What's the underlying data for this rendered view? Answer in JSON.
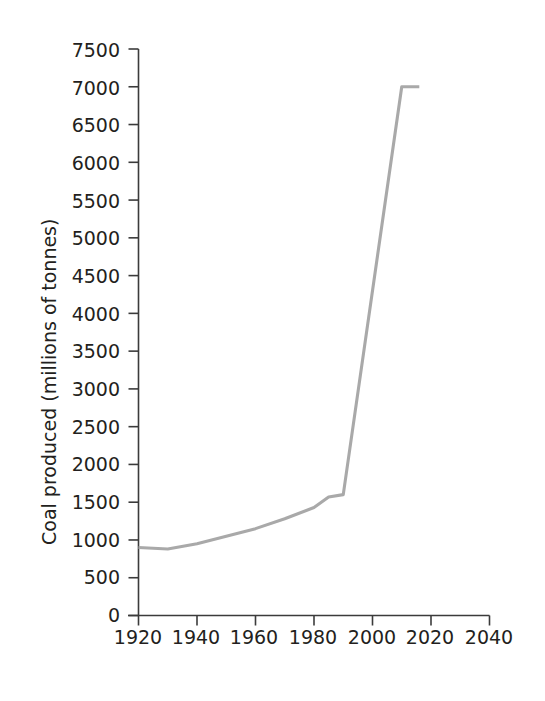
{
  "chart_data": {
    "type": "line",
    "title": "",
    "subtitle": "",
    "xlabel": "",
    "ylabel": "Coal produced (millions of tonnes)",
    "xlim": [
      1920,
      2040
    ],
    "ylim": [
      0,
      7500
    ],
    "grid": false,
    "legend": null,
    "legend_position": "none",
    "line_color": "#a9a9a9",
    "axis_color": "#3b3b3b",
    "text_color": "#231f20",
    "x_ticks": [
      1920,
      1940,
      1960,
      1980,
      2000,
      2020,
      2040
    ],
    "x_tick_labels": [
      "1920",
      "1940",
      "1960",
      "1980",
      "2000",
      "2020",
      "2040"
    ],
    "y_ticks": [
      0,
      500,
      1000,
      1500,
      2000,
      2500,
      3000,
      3500,
      4000,
      4500,
      5000,
      5500,
      6000,
      6500,
      7000,
      7500
    ],
    "y_tick_labels": [
      "0",
      "500",
      "1000",
      "1500",
      "2000",
      "2500",
      "3000",
      "3500",
      "4000",
      "4500",
      "5000",
      "5500",
      "6000",
      "6500",
      "7000",
      "7500"
    ],
    "series": [
      {
        "name": "Coal produced",
        "x": [
          1920,
          1930,
          1940,
          1950,
          1960,
          1970,
          1980,
          1985,
          1990,
          2010,
          2016
        ],
        "values": [
          900,
          880,
          950,
          1050,
          1150,
          1280,
          1430,
          1570,
          1600,
          7000,
          7000
        ]
      }
    ],
    "annotations": []
  }
}
